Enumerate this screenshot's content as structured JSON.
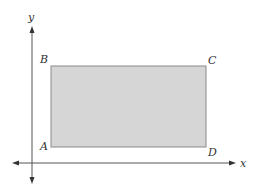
{
  "diagram": {
    "type": "coordinate-plane-rectangle",
    "axes": {
      "x_label": "x",
      "y_label": "y"
    },
    "rectangle": {
      "fill": "#d6d6d6",
      "stroke": "#8a8a8a",
      "vertices": [
        {
          "label": "A",
          "position": "bottom-left"
        },
        {
          "label": "B",
          "position": "top-left"
        },
        {
          "label": "C",
          "position": "top-right"
        },
        {
          "label": "D",
          "position": "bottom-right"
        }
      ]
    },
    "colors": {
      "axis": "#555555",
      "text": "#333333"
    }
  }
}
